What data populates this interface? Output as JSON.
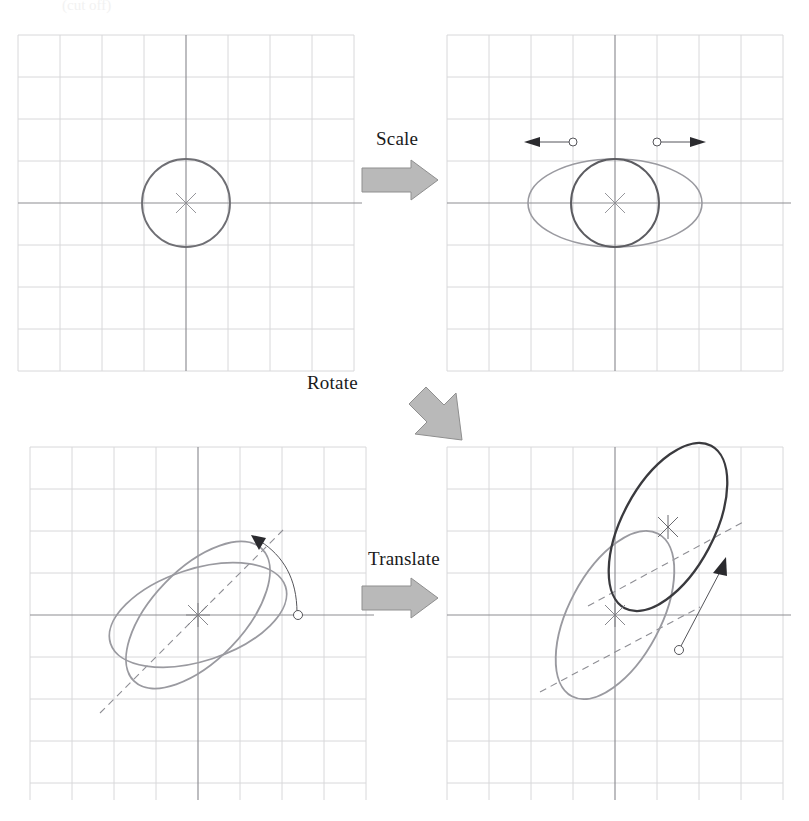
{
  "figure": {
    "background": "#ffffff",
    "width": 809,
    "height": 821,
    "top_cut_note": "(cut off)"
  },
  "colors": {
    "grid_minor": "#d8d8da",
    "grid_major": "#8d8d92",
    "axis": "#6e6e73",
    "shape_dark": "#3a3a3e",
    "shape_mid": "#6f6f74",
    "shape_light": "#9a9aa0",
    "dashed": "#8e8e94",
    "handle_stroke": "#55555a",
    "arrow_fill": "#b9b9b9",
    "arrow_stroke": "#8a8a8a",
    "label_text": "#1a1a1a",
    "marker": "#7a7a80"
  },
  "steps": [
    {
      "id": "scale",
      "label": "Scale",
      "arrow": "right-block-arrow",
      "direction": "right"
    },
    {
      "id": "rotate",
      "label": "Rotate",
      "arrow": "diagonal-block-arrow",
      "direction": "down-left"
    },
    {
      "id": "translate",
      "label": "Translate",
      "arrow": "right-block-arrow",
      "direction": "right"
    }
  ],
  "panels": [
    {
      "id": "original",
      "name": "panel-original-circle",
      "position": "top-left",
      "grid": {
        "cols": 8,
        "rows": 8,
        "cell": 42,
        "x0": 18,
        "y0": 35
      },
      "axes": {
        "origin_x": 186,
        "origin_y": 203
      },
      "shapes": [
        {
          "kind": "circle",
          "name": "original-circle",
          "cx": 186,
          "cy": 203,
          "rx": 44,
          "ry": 44,
          "rotation": 0,
          "tone": "shape_mid",
          "width": 1.9
        }
      ],
      "markers": [
        {
          "name": "center-marker",
          "x": 186,
          "y": 203,
          "type": "asterisk"
        }
      ],
      "handles": [],
      "dashed_axes": []
    },
    {
      "id": "scaled",
      "name": "panel-scaled-ellipse",
      "position": "top-right",
      "grid": {
        "cols": 8,
        "rows": 8,
        "cell": 42,
        "x0": 447,
        "y0": 35
      },
      "axes": {
        "origin_x": 615,
        "origin_y": 203
      },
      "shapes": [
        {
          "kind": "ellipse",
          "name": "scaled-ellipse",
          "cx": 615,
          "cy": 203,
          "rx": 87,
          "ry": 44,
          "rotation": 0,
          "tone": "shape_light",
          "width": 1.6
        },
        {
          "kind": "circle",
          "name": "source-circle",
          "cx": 615,
          "cy": 203,
          "rx": 44,
          "ry": 44,
          "rotation": 0,
          "tone": "shape_mid",
          "width": 1.9
        }
      ],
      "markers": [
        {
          "name": "center-marker",
          "x": 615,
          "y": 203,
          "type": "asterisk"
        }
      ],
      "handles": [
        {
          "name": "scale-handle-left",
          "x": 572,
          "y": 142,
          "arrow_to_x": 534,
          "arrow_to_y": 142
        },
        {
          "name": "scale-handle-right",
          "x": 658,
          "y": 142,
          "arrow_to_x": 696,
          "arrow_to_y": 142
        }
      ],
      "dashed_axes": []
    },
    {
      "id": "rotated",
      "name": "panel-rotated-ellipse",
      "position": "bottom-left",
      "grid": {
        "cols": 8,
        "rows": 8,
        "cell": 42,
        "x0": 30,
        "y0": 447
      },
      "axes": {
        "origin_x": 198,
        "origin_y": 615
      },
      "shapes": [
        {
          "kind": "ellipse",
          "name": "pre-rotation-ellipse",
          "cx": 198,
          "cy": 615,
          "rx": 92,
          "ry": 46,
          "rotation": -18,
          "tone": "shape_light",
          "width": 1.8
        },
        {
          "kind": "ellipse",
          "name": "rotated-ellipse",
          "cx": 198,
          "cy": 615,
          "rx": 92,
          "ry": 46,
          "rotation": -46,
          "tone": "shape_light",
          "width": 1.8
        }
      ],
      "markers": [
        {
          "name": "center-marker",
          "x": 198,
          "y": 615,
          "type": "asterisk"
        }
      ],
      "handles": [
        {
          "name": "rotation-handle",
          "x": 297,
          "y": 615,
          "arrow_to_x": 255,
          "arrow_to_y": 543
        }
      ],
      "dashed_axes": [
        {
          "name": "rotation-axis-dashed",
          "x1": 100,
          "y1": 713,
          "x2": 283,
          "y2": 530,
          "angle": -45
        }
      ]
    },
    {
      "id": "translated",
      "name": "panel-translated-ellipse",
      "position": "bottom-right",
      "grid": {
        "cols": 8,
        "rows": 8,
        "cell": 42,
        "x0": 447,
        "y0": 447
      },
      "axes": {
        "origin_x": 615,
        "origin_y": 615
      },
      "shapes": [
        {
          "kind": "ellipse",
          "name": "source-ellipse",
          "cx": 615,
          "cy": 615,
          "rx": 92,
          "ry": 46,
          "rotation": -62,
          "tone": "shape_light",
          "width": 1.8
        },
        {
          "kind": "ellipse",
          "name": "translated-ellipse",
          "cx": 668,
          "cy": 527,
          "rx": 92,
          "ry": 46,
          "rotation": -62,
          "tone": "shape_dark",
          "width": 2.2
        }
      ],
      "markers": [
        {
          "name": "center-marker-source",
          "x": 615,
          "y": 615,
          "type": "asterisk"
        },
        {
          "name": "center-marker-translated",
          "x": 668,
          "y": 527,
          "type": "asterisk"
        }
      ],
      "handles": [
        {
          "name": "translation-handle",
          "x": 683,
          "y": 650,
          "arrow_to_x": 723,
          "arrow_to_y": 566
        }
      ],
      "dashed_axes": [
        {
          "name": "source-axis-dashed",
          "x1": 540,
          "y1": 690,
          "x2": 690,
          "y2": 610,
          "angle": -28
        },
        {
          "name": "translated-axis-dashed",
          "x1": 590,
          "y1": 604,
          "x2": 742,
          "y2": 522,
          "angle": -28
        }
      ]
    }
  ],
  "labels": {
    "scale": {
      "text": "Scale",
      "x": 376,
      "y": 140
    },
    "rotate": {
      "text": "Rotate",
      "x": 307,
      "y": 380
    },
    "translate": {
      "text": "Translate",
      "x": 370,
      "y": 557
    }
  }
}
